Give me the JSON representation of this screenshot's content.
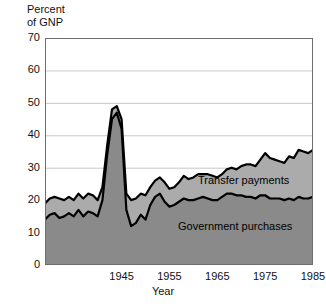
{
  "chart_data": {
    "type": "area",
    "stacked": true,
    "title": "",
    "xlabel": "Year",
    "ylabel": "Percent of GNP",
    "ylabel_lines": [
      "Percent",
      "of GNP"
    ],
    "xlim": [
      1929,
      1985
    ],
    "ylim": [
      0,
      70
    ],
    "yticks": [
      0,
      10,
      20,
      30,
      40,
      50,
      60,
      70
    ],
    "xticks": [
      1945,
      1955,
      1965,
      1975,
      1985
    ],
    "grid": "horizontal",
    "legend_position": "inline-annotation",
    "colors": {
      "government_purchases": "#8a8a8a",
      "transfer_payments": "#ababab",
      "outline": "#000000",
      "gridline": "#c8c8c8",
      "background": "#ffffff"
    },
    "x": [
      1929,
      1930,
      1931,
      1932,
      1933,
      1934,
      1935,
      1936,
      1937,
      1938,
      1939,
      1940,
      1941,
      1942,
      1943,
      1944,
      1945,
      1946,
      1947,
      1948,
      1949,
      1950,
      1951,
      1952,
      1953,
      1954,
      1955,
      1956,
      1957,
      1958,
      1959,
      1960,
      1961,
      1962,
      1963,
      1964,
      1965,
      1966,
      1967,
      1968,
      1969,
      1970,
      1971,
      1972,
      1973,
      1974,
      1975,
      1976,
      1977,
      1978,
      1979,
      1980,
      1981,
      1982,
      1983,
      1984,
      1985
    ],
    "series": [
      {
        "name": "Government purchases",
        "values": [
          14.0,
          15.5,
          16.0,
          14.5,
          15.0,
          16.0,
          15.0,
          17.0,
          15.0,
          16.5,
          16.0,
          15.0,
          20.0,
          34.0,
          45.0,
          47.0,
          42.0,
          17.0,
          12.0,
          13.0,
          15.5,
          14.0,
          18.5,
          21.0,
          22.0,
          19.5,
          18.0,
          18.5,
          19.5,
          20.5,
          20.0,
          20.0,
          20.5,
          21.0,
          20.5,
          20.0,
          20.0,
          21.0,
          22.0,
          22.0,
          21.5,
          21.5,
          21.0,
          21.0,
          20.5,
          21.5,
          21.5,
          20.5,
          20.5,
          20.5,
          20.0,
          20.5,
          20.0,
          21.0,
          20.5,
          20.5,
          21.0
        ]
      },
      {
        "name": "Transfer payments",
        "values": [
          5.0,
          5.0,
          5.0,
          6.0,
          5.0,
          5.0,
          5.0,
          5.0,
          5.5,
          5.5,
          5.5,
          5.0,
          4.0,
          3.0,
          3.0,
          2.0,
          3.0,
          5.0,
          8.0,
          7.5,
          6.5,
          7.5,
          5.5,
          5.0,
          5.0,
          6.0,
          5.5,
          5.5,
          6.0,
          7.0,
          6.5,
          7.0,
          7.5,
          7.0,
          7.5,
          7.5,
          7.0,
          7.0,
          7.5,
          8.0,
          8.0,
          9.0,
          10.0,
          10.0,
          10.0,
          11.0,
          13.0,
          12.5,
          12.0,
          11.5,
          11.5,
          13.0,
          13.0,
          14.5,
          14.5,
          14.0,
          14.5
        ]
      }
    ],
    "totals": [
      19.0,
      20.5,
      21.0,
      20.5,
      20.0,
      21.0,
      20.0,
      22.0,
      20.5,
      22.0,
      21.5,
      20.0,
      24.0,
      37.0,
      48.0,
      49.0,
      45.0,
      22.0,
      20.0,
      20.5,
      22.0,
      21.5,
      24.0,
      26.0,
      27.0,
      25.5,
      23.5,
      24.0,
      25.5,
      27.5,
      26.5,
      27.0,
      28.0,
      28.0,
      28.0,
      27.5,
      27.0,
      28.0,
      29.5,
      30.0,
      29.5,
      30.5,
      31.0,
      31.0,
      30.5,
      32.5,
      34.5,
      33.0,
      32.5,
      32.0,
      31.5,
      33.5,
      33.0,
      35.5,
      35.0,
      34.5,
      35.5
    ],
    "annotations": [
      {
        "text": "Transfer payments",
        "series": "Transfer payments"
      },
      {
        "text": "Government purchases",
        "series": "Government purchases"
      }
    ]
  }
}
